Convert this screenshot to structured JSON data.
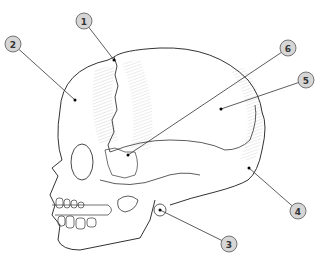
{
  "diagram": {
    "colors": {
      "outline": "#333333",
      "callout_fill": "#d6d6d6",
      "callout_stroke": "#555555",
      "hatch": "#bbbbbb"
    },
    "labels": [
      {
        "id": "1",
        "text": "1",
        "cx": 84,
        "cy": 21,
        "tx": 114,
        "ty": 60
      },
      {
        "id": "2",
        "text": "2",
        "cx": 13,
        "cy": 44,
        "tx": 75,
        "ty": 100
      },
      {
        "id": "3",
        "text": "3",
        "cx": 229,
        "cy": 244,
        "tx": 160,
        "ty": 210
      },
      {
        "id": "4",
        "text": "4",
        "cx": 298,
        "cy": 211,
        "tx": 249,
        "ty": 168
      },
      {
        "id": "5",
        "text": "5",
        "cx": 306,
        "cy": 80,
        "tx": 221,
        "ty": 109
      },
      {
        "id": "6",
        "text": "6",
        "cx": 288,
        "cy": 48,
        "tx": 128,
        "ty": 155
      }
    ],
    "watermark": ""
  }
}
